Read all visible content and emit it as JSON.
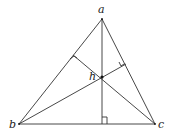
{
  "diagram": {
    "vertices": {
      "a": {
        "label": "a",
        "x": 102,
        "y": 19
      },
      "b": {
        "label": "b",
        "x": 19,
        "y": 124
      },
      "c": {
        "label": "c",
        "x": 155,
        "y": 124
      }
    },
    "orthocenter": {
      "label": "h",
      "x": 102,
      "y": 77
    },
    "feet": {
      "on_ab": {
        "x": 73,
        "y": 55
      },
      "on_ac": {
        "x": 126,
        "y": 64
      },
      "on_bc": {
        "x": 102,
        "y": 124
      }
    },
    "colors": {
      "line": "#333333",
      "text": "#222222"
    }
  }
}
